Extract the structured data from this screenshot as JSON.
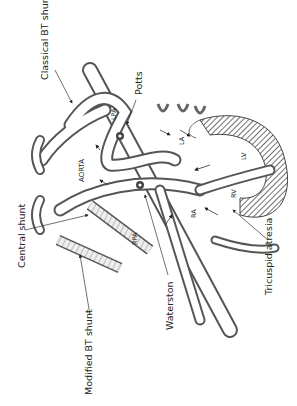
{
  "figure": {
    "orientation": "rotated-90",
    "labels": {
      "classical_bt_shunt": "Classical BT shunt",
      "potts": "Potts",
      "central_shunt": "Central shunt",
      "modified_bt_shunt": "Modified BT shunt",
      "waterston": "Waterston",
      "tricuspid_atresia": "Tricuspid atresia"
    },
    "anatomy": {
      "aorta": "AORTA",
      "lpa": "LPA",
      "rpa": "RPA",
      "la": "LA",
      "lv": "LV",
      "rv": "RV",
      "ra": "RA"
    }
  }
}
